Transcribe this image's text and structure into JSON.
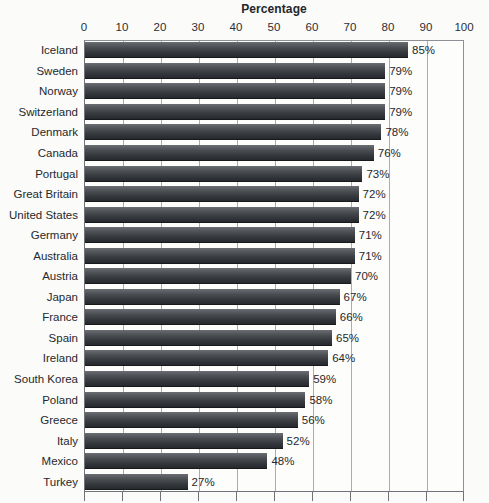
{
  "chart_data": {
    "type": "bar",
    "orientation": "horizontal",
    "title": "Percentage",
    "xlabel": "",
    "ylabel": "",
    "xlim": [
      0,
      100
    ],
    "xticks": [
      0,
      10,
      20,
      30,
      40,
      50,
      60,
      70,
      80,
      90,
      100
    ],
    "grid": true,
    "legend": false,
    "value_suffix": "%",
    "categories": [
      "Iceland",
      "Sweden",
      "Norway",
      "Switzerland",
      "Denmark",
      "Canada",
      "Portugal",
      "Great Britain",
      "United States",
      "Germany",
      "Australia",
      "Austria",
      "Japan",
      "France",
      "Spain",
      "Ireland",
      "South Korea",
      "Poland",
      "Greece",
      "Italy",
      "Mexico",
      "Turkey"
    ],
    "values": [
      85,
      79,
      79,
      79,
      78,
      76,
      73,
      72,
      72,
      71,
      71,
      70,
      67,
      66,
      65,
      64,
      59,
      58,
      56,
      52,
      48,
      27
    ],
    "value_labels": [
      "85%",
      "79%",
      "79%",
      "79%",
      "78%",
      "76%",
      "73%",
      "72%",
      "72%",
      "71%",
      "71%",
      "70%",
      "67%",
      "66%",
      "65%",
      "64%",
      "59%",
      "58%",
      "56%",
      "52%",
      "48%",
      "27%"
    ],
    "bar_color_top": "#6b6f73",
    "bar_color_bottom": "#262a2e",
    "plot_background": "#fdfdfb",
    "grid_color": "#a9adb1",
    "axis_color": "#6f7377",
    "text_color": "#25292d"
  }
}
